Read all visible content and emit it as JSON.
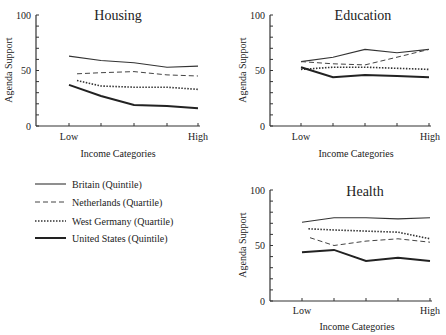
{
  "chart_data": [
    {
      "type": "line",
      "title": "Housing",
      "xlabel": "Income Categories",
      "ylabel": "Agenda Support",
      "ylim": [
        0,
        100
      ],
      "yticks": [
        0,
        50,
        100
      ],
      "x_tick_labels": [
        "Low",
        "High"
      ],
      "categories": [
        1,
        2,
        3,
        4,
        5
      ],
      "series": [
        {
          "name": "Britain (Quintile)",
          "values": [
            63,
            59,
            57,
            53,
            54
          ]
        },
        {
          "name": "Netherlands (Quartile)",
          "values": [
            47,
            48,
            49,
            46,
            45
          ]
        },
        {
          "name": "West Germany (Quartile)",
          "values": [
            41,
            36,
            35,
            35,
            33
          ]
        },
        {
          "name": "United States (Quintile)",
          "values": [
            37,
            27,
            19,
            18,
            16
          ]
        }
      ]
    },
    {
      "type": "line",
      "title": "Education",
      "xlabel": "Income Categories",
      "ylabel": "Agenda Support",
      "ylim": [
        0,
        100
      ],
      "yticks": [
        0,
        50,
        100
      ],
      "x_tick_labels": [
        "Low",
        "High"
      ],
      "categories": [
        1,
        2,
        3,
        4,
        5
      ],
      "series": [
        {
          "name": "Britain (Quintile)",
          "values": [
            58,
            62,
            69,
            66,
            69
          ]
        },
        {
          "name": "Netherlands (Quartile)",
          "values": [
            58,
            56,
            55,
            62,
            69
          ]
        },
        {
          "name": "West Germany (Quartile)",
          "values": [
            51,
            53,
            53,
            52,
            51
          ]
        },
        {
          "name": "United States (Quintile)",
          "values": [
            53,
            44,
            46,
            45,
            44
          ]
        }
      ]
    },
    {
      "type": "line",
      "title": "Health",
      "xlabel": "Income Categories",
      "ylabel": "Agenda Support",
      "ylim": [
        0,
        100
      ],
      "yticks": [
        0,
        50,
        100
      ],
      "x_tick_labels": [
        "Low",
        "High"
      ],
      "categories": [
        1,
        2,
        3,
        4,
        5
      ],
      "series": [
        {
          "name": "Britain (Quintile)",
          "values": [
            71,
            75,
            75,
            74,
            75
          ]
        },
        {
          "name": "Netherlands (Quartile)",
          "values": [
            57,
            50,
            54,
            56,
            53
          ]
        },
        {
          "name": "West Germany (Quartile)",
          "values": [
            65,
            64,
            63,
            62,
            56
          ]
        },
        {
          "name": "United States (Quintile)",
          "values": [
            44,
            46,
            36,
            39,
            36
          ]
        }
      ]
    }
  ],
  "panels": {
    "housing": {
      "title": "Housing",
      "ylabel": "Agenda Support",
      "xlabel": "Income Categories",
      "y0": "0",
      "y50": "50",
      "y100": "100",
      "low": "Low",
      "high": "High"
    },
    "education": {
      "title": "Education",
      "ylabel": "Agenda Support",
      "xlabel": "Income Categories",
      "y0": "0",
      "y50": "50",
      "y100": "100",
      "low": "Low",
      "high": "High"
    },
    "health": {
      "title": "Health",
      "ylabel": "Agenda Support",
      "xlabel": "Income Categories",
      "y0": "0",
      "y50": "50",
      "y100": "100",
      "low": "Low",
      "high": "High"
    }
  },
  "legend": {
    "items": [
      {
        "label": "Britain (Quintile)",
        "style": "solid-thin"
      },
      {
        "label": "Netherlands (Quartile)",
        "style": "dashed"
      },
      {
        "label": "West Germany (Quartile)",
        "style": "dotted"
      },
      {
        "label": "United States (Quintile)",
        "style": "solid-thick"
      }
    ]
  }
}
